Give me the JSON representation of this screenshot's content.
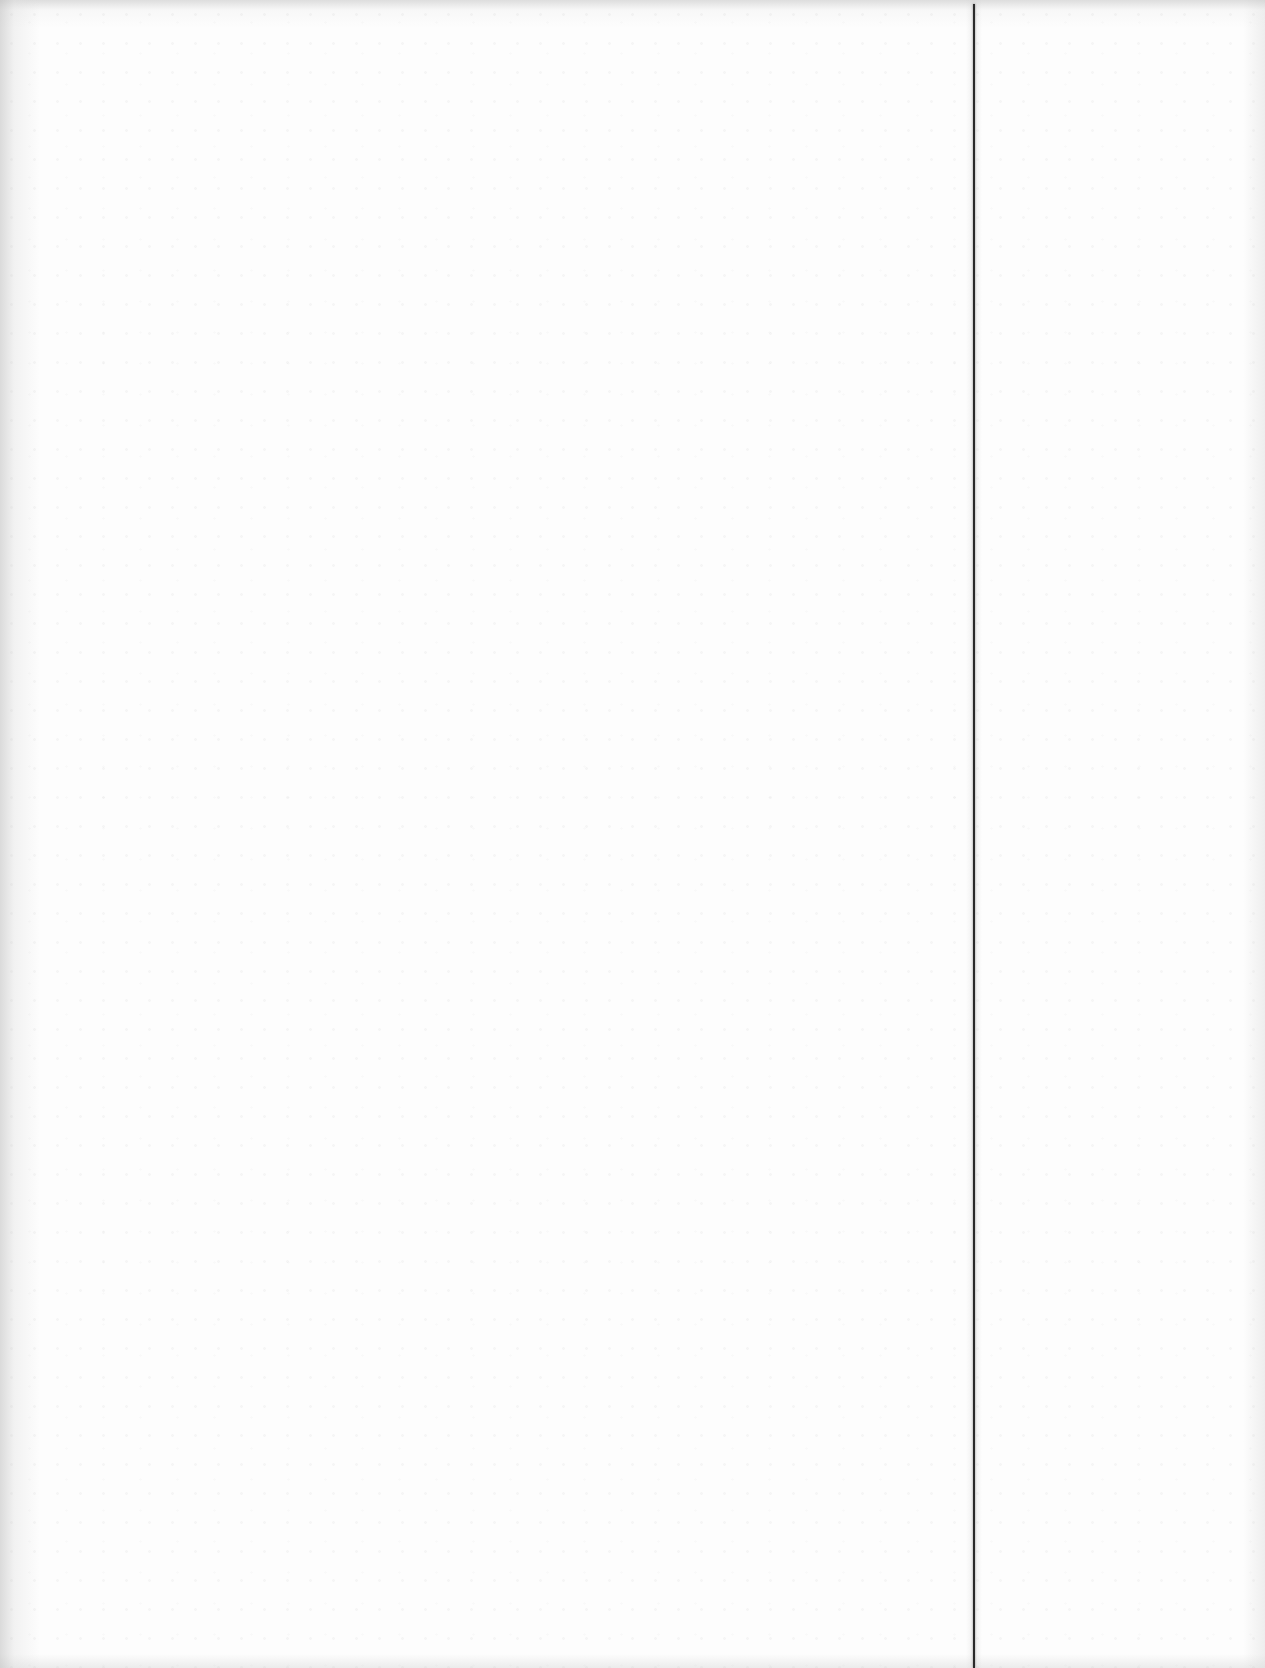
{
  "document": {
    "type": "scanned-blank-page",
    "left_panel": {
      "text": ""
    },
    "right_panel": {
      "text": ""
    },
    "divider": {
      "orientation": "vertical",
      "color": "#2a2a2a"
    },
    "background_color": "#fdfdfd",
    "edge_shading_color": "#bebebe"
  }
}
